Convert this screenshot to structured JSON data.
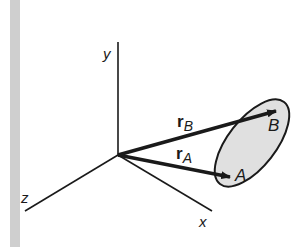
{
  "diagram": {
    "title": "",
    "axes": {
      "x_label": "x",
      "y_label": "y",
      "z_label": "z"
    },
    "vectors": [
      {
        "name": "r_B",
        "main": "r",
        "subscript": "B",
        "from": "origin",
        "to": "B"
      },
      {
        "name": "r_A",
        "main": "r",
        "subscript": "A",
        "from": "origin",
        "to": "A"
      }
    ],
    "points": [
      {
        "label": "B"
      },
      {
        "label": "A"
      }
    ],
    "region": {
      "shape": "ellipse",
      "fill": "#e0e0e0",
      "stroke": "#1a1a1a"
    },
    "colors": {
      "line": "#1a1a1a",
      "sidebar_bar": "#cfcfcf",
      "background": "#ffffff"
    }
  }
}
